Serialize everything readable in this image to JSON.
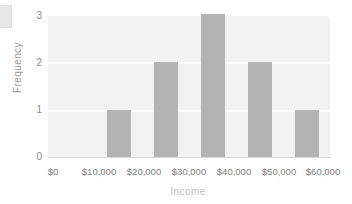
{
  "chart_data": {
    "type": "bar",
    "title": "",
    "subtitle": "",
    "xlabel": "Income",
    "ylabel": "Frequency",
    "categories": [
      "$0–$10,000",
      "$10,000–$20,000",
      "$20,000–$30,000",
      "$30,000–$40,000",
      "$40,000–$50,000",
      "$50,000–$60,000"
    ],
    "values": [
      0,
      1,
      2,
      3,
      2,
      1
    ],
    "bin_edges": [
      0,
      10000,
      20000,
      30000,
      40000,
      50000,
      60000
    ],
    "xlim": [
      0,
      60000
    ],
    "ylim": [
      0,
      3
    ],
    "x_tick_labels": [
      "$0",
      "$10,000",
      "$20,000",
      "$30,000",
      "$40,000",
      "$50,000",
      "$60,000"
    ],
    "x_tick_values": [
      0,
      10000,
      20000,
      30000,
      40000,
      50000,
      60000
    ],
    "y_tick_labels": [
      "0",
      "1",
      "2",
      "3"
    ],
    "y_tick_values": [
      0,
      1,
      2,
      3
    ],
    "grid": "horizontal",
    "legend": "none",
    "annotations": [],
    "colors": {
      "bar": "#b3b3b3",
      "plot_background": "#f2f2f2",
      "gridline": "#ffffff",
      "page_background": "#ffffff",
      "tick_text": "#7e7e7e",
      "y_axis_title": "#9a9a9a",
      "x_axis_title": "#c2c2c2",
      "baseline": "#d9d9d9"
    }
  }
}
